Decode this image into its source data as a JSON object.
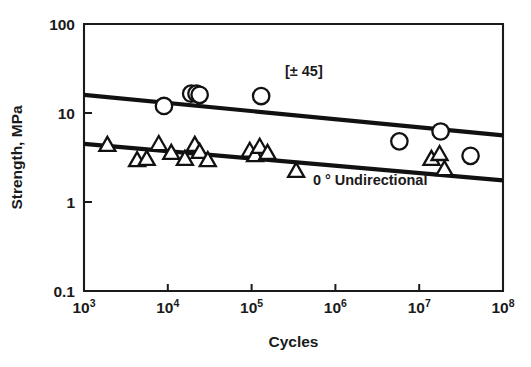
{
  "chart_data": {
    "type": "scatter",
    "title": "",
    "xlabel": "Cycles",
    "ylabel": "Strength, MPa",
    "xscale": "log",
    "yscale": "log",
    "xlim": [
      1000,
      100000000
    ],
    "ylim": [
      0.1,
      100
    ],
    "grid": false,
    "legend_position": "inline-annotations",
    "xticklabels": [
      "10",
      "10",
      "10",
      "10",
      "10",
      "10"
    ],
    "xtickexponents": [
      "3",
      "4",
      "5",
      "6",
      "7",
      "8"
    ],
    "xtickvalues": [
      1000,
      10000,
      100000,
      1000000,
      10000000,
      100000000
    ],
    "yticklabels": [
      "100",
      "10",
      "1",
      "0.1"
    ],
    "ytickvalues": [
      100,
      10,
      1,
      0.1
    ],
    "series": [
      {
        "name": "[± 45]",
        "marker": "circle",
        "annotation": "[± 45]",
        "annotation_x": 420000,
        "annotation_y": 26,
        "points": [
          {
            "x": 9000,
            "y": 12.0
          },
          {
            "x": 19000,
            "y": 16.5
          },
          {
            "x": 22000,
            "y": 16.5
          },
          {
            "x": 24000,
            "y": 16.0
          },
          {
            "x": 130000,
            "y": 15.5
          },
          {
            "x": 5800000,
            "y": 4.8
          },
          {
            "x": 18000000,
            "y": 6.2
          },
          {
            "x": 41000000,
            "y": 3.3
          }
        ],
        "trend": {
          "x1": 1000,
          "y1": 16.0,
          "x2": 100000000,
          "y2": 5.6
        }
      },
      {
        "name": "0 ° Undirectional",
        "marker": "triangle",
        "annotation": "0 ° Undirectional",
        "annotation_x": 2600000,
        "annotation_y": 1.55,
        "points": [
          {
            "x": 1900,
            "y": 4.3
          },
          {
            "x": 4300,
            "y": 2.9
          },
          {
            "x": 5600,
            "y": 3.0
          },
          {
            "x": 7800,
            "y": 4.4
          },
          {
            "x": 11000,
            "y": 3.5
          },
          {
            "x": 16000,
            "y": 3.0
          },
          {
            "x": 21000,
            "y": 4.3
          },
          {
            "x": 24000,
            "y": 3.6
          },
          {
            "x": 30000,
            "y": 2.9
          },
          {
            "x": 95000,
            "y": 3.7
          },
          {
            "x": 110000,
            "y": 3.3
          },
          {
            "x": 125000,
            "y": 4.1
          },
          {
            "x": 155000,
            "y": 3.5
          },
          {
            "x": 340000,
            "y": 2.2
          },
          {
            "x": 14000000,
            "y": 3.0
          },
          {
            "x": 17500000,
            "y": 3.4
          },
          {
            "x": 20000000,
            "y": 2.3
          }
        ],
        "trend": {
          "x1": 1000,
          "y1": 4.5,
          "x2": 100000000,
          "y2": 1.75
        }
      }
    ]
  },
  "axis": {
    "x_title": "Cycles",
    "y_title": "Strength, MPa"
  },
  "colors": {
    "ink": "#1a1a1a",
    "marker_fill": "#ffffff",
    "background": "#ffffff"
  }
}
